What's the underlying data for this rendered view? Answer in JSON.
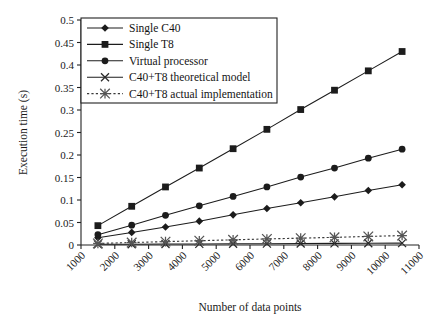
{
  "chart_data": {
    "type": "line",
    "title": "",
    "xlabel": "Number of data points",
    "ylabel": "Execution time (s)",
    "xlim": [
      1000,
      11000
    ],
    "ylim": [
      0,
      0.5
    ],
    "xticks": [
      1000,
      2000,
      3000,
      4000,
      5000,
      6000,
      7000,
      8000,
      9000,
      10000,
      11000
    ],
    "xtick_labels": [
      "1000",
      "2000",
      "3000",
      "4000",
      "5000",
      "6000",
      "7000",
      "8000",
      "9000",
      "10000",
      "11000"
    ],
    "yticks": [
      0,
      0.05,
      0.1,
      0.15,
      0.2,
      0.25,
      0.3,
      0.35,
      0.4,
      0.45,
      0.5
    ],
    "ytick_labels": [
      "0",
      "0.05",
      "0.1",
      "0.15",
      "0.2",
      "0.25",
      "0.3",
      "0.35",
      "0.4",
      "0.45",
      "0.5"
    ],
    "grid": false,
    "legend_position": "top-left",
    "x": [
      1500,
      2500,
      3500,
      4500,
      5500,
      6500,
      7500,
      8500,
      9500,
      10500
    ],
    "series": [
      {
        "name": "Single C40",
        "marker": "diamond",
        "linestyle": "solid",
        "color": "#1c1c1c",
        "values": [
          0.016,
          0.028,
          0.04,
          0.053,
          0.067,
          0.081,
          0.094,
          0.107,
          0.121,
          0.134
        ]
      },
      {
        "name": "Single T8",
        "marker": "square",
        "linestyle": "solid",
        "color": "#1c1c1c",
        "values": [
          0.043,
          0.086,
          0.129,
          0.171,
          0.214,
          0.257,
          0.301,
          0.344,
          0.387,
          0.43
        ]
      },
      {
        "name": "Virtual processor",
        "marker": "circle",
        "linestyle": "solid",
        "color": "#1c1c1c",
        "values": [
          0.023,
          0.044,
          0.066,
          0.087,
          0.108,
          0.129,
          0.151,
          0.171,
          0.193,
          0.213
        ]
      },
      {
        "name": "C40+T8 theoretical model",
        "marker": "x",
        "linestyle": "solid",
        "color": "#2a2a2a",
        "values": [
          0.0015,
          0.0018,
          0.0021,
          0.0024,
          0.0027,
          0.003,
          0.0033,
          0.0036,
          0.0039,
          0.0042
        ]
      },
      {
        "name": "C40+T8 actual implementation",
        "marker": "star",
        "linestyle": "dotted",
        "color": "#555555",
        "values": [
          0.0035,
          0.0055,
          0.0075,
          0.0095,
          0.0115,
          0.0135,
          0.0152,
          0.017,
          0.019,
          0.021
        ]
      }
    ]
  }
}
